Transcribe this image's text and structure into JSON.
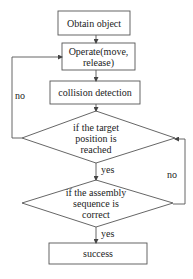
{
  "diagram": {
    "type": "flowchart",
    "colors": {
      "stroke": "#555555",
      "text": "#222222",
      "background": "#ffffff"
    },
    "nodes": [
      {
        "id": "obtain",
        "shape": "rect",
        "label": "Obtain object"
      },
      {
        "id": "operate",
        "shape": "rect",
        "label": "Operate(move,\nrelease)"
      },
      {
        "id": "collision",
        "shape": "rect",
        "label": "collision detection"
      },
      {
        "id": "target",
        "shape": "diamond",
        "label": "if the target\nposition is\nreached"
      },
      {
        "id": "sequence",
        "shape": "diamond",
        "label": "if the assembly\nsequence is\ncorrect"
      },
      {
        "id": "success",
        "shape": "rect",
        "label": "success"
      }
    ],
    "edges": [
      {
        "from": "obtain",
        "to": "operate",
        "label": ""
      },
      {
        "from": "operate",
        "to": "collision",
        "label": ""
      },
      {
        "from": "collision",
        "to": "target",
        "label": ""
      },
      {
        "from": "target",
        "to": "operate",
        "label": "no"
      },
      {
        "from": "target",
        "to": "sequence",
        "label": "yes"
      },
      {
        "from": "sequence",
        "to": "target",
        "label": "no"
      },
      {
        "from": "sequence",
        "to": "success",
        "label": "yes"
      }
    ]
  }
}
